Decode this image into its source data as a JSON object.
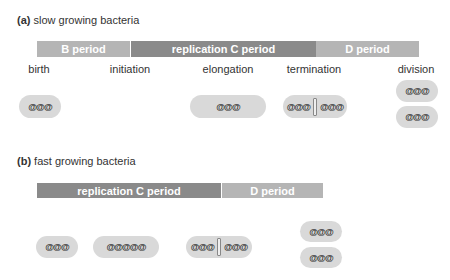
{
  "panel_a": {
    "letter": "(a)",
    "title": "slow growing bacteria",
    "periods": [
      {
        "label": "B period",
        "color": "#b5b5b5"
      },
      {
        "label": "replication C period",
        "color": "#8a8a8a"
      },
      {
        "label": "D period",
        "color": "#b5b5b5"
      }
    ],
    "stages": [
      "birth",
      "initiation",
      "elongation",
      "termination",
      "division"
    ],
    "dna": "@@@"
  },
  "panel_b": {
    "letter": "(b)",
    "title": "fast growing bacteria",
    "periods": [
      {
        "label": "replication C period",
        "color": "#8a8a8a"
      },
      {
        "label": "D period",
        "color": "#b5b5b5"
      }
    ],
    "dna": "@@@",
    "dna_long": "@@@@@"
  }
}
